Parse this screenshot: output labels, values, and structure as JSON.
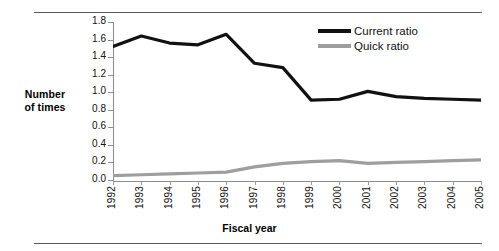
{
  "chart_data": {
    "type": "line",
    "title": "",
    "xlabel": "Fiscal year",
    "ylabel": "Number of times",
    "categories": [
      "1992",
      "1993",
      "1994",
      "1995",
      "1996",
      "1997",
      "1998",
      "1999",
      "2000",
      "2001",
      "2002",
      "2003",
      "2004",
      "2005"
    ],
    "ylim": [
      0.0,
      1.8
    ],
    "yticks": [
      "0.0",
      "0.2",
      "0.4",
      "0.6",
      "0.8",
      "1.0",
      "1.2",
      "1.4",
      "1.6",
      "1.8"
    ],
    "grid": false,
    "legend_position": "top-right",
    "series": [
      {
        "name": "Current ratio",
        "color": "#111111",
        "values": [
          1.52,
          1.64,
          1.56,
          1.54,
          1.66,
          1.33,
          1.28,
          0.91,
          0.92,
          1.01,
          0.95,
          0.93,
          0.92,
          0.91
        ]
      },
      {
        "name": "Quick ratio",
        "color": "#9e9e9e",
        "values": [
          0.05,
          0.06,
          0.07,
          0.08,
          0.09,
          0.15,
          0.19,
          0.21,
          0.22,
          0.19,
          0.2,
          0.21,
          0.22,
          0.23
        ]
      }
    ]
  },
  "axes": {
    "y_caption_line1": "Number",
    "y_caption_line2": "of times"
  },
  "legend": {
    "items": [
      {
        "label": "Current ratio",
        "color": "#111111"
      },
      {
        "label": "Quick ratio",
        "color": "#9e9e9e"
      }
    ]
  }
}
